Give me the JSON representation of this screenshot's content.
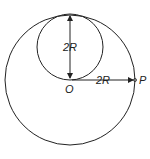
{
  "diagram": {
    "type": "physics-geometry",
    "outer_circle": {
      "label": "outer-sphere",
      "center": [
        70,
        80
      ],
      "radius": 65
    },
    "inner_circle": {
      "label": "inner-cavity",
      "center": [
        70,
        47
      ],
      "radius": 33
    },
    "labels": {
      "diameter": "2R",
      "radius_to_p": "2R",
      "origin": "O",
      "point": "P"
    },
    "colors": {
      "stroke": "#222222",
      "background": "#ffffff"
    }
  }
}
